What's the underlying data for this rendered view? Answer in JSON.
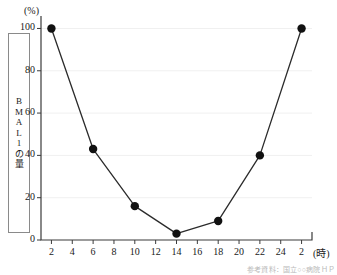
{
  "chart_data": {
    "type": "line",
    "title": "",
    "xlabel": "(時)",
    "ylabel": "BMAL1の量",
    "yunit": "(%)",
    "x": [
      2,
      6,
      10,
      14,
      18,
      22,
      26
    ],
    "values": [
      100,
      43,
      16,
      3,
      9,
      40,
      100
    ],
    "xtick_labels": [
      "2",
      "4",
      "6",
      "8",
      "10",
      "12",
      "14",
      "16",
      "18",
      "20",
      "22",
      "24",
      "2"
    ],
    "xtick_values": [
      2,
      4,
      6,
      8,
      10,
      12,
      14,
      16,
      18,
      20,
      22,
      24,
      26
    ],
    "ytick_labels": [
      "0",
      "20",
      "40",
      "60",
      "80",
      "100"
    ],
    "ytick_values": [
      0,
      20,
      40,
      60,
      80,
      100
    ],
    "xlim": [
      1,
      27
    ],
    "ylim": [
      0,
      104
    ],
    "grid": true,
    "legend": "none",
    "series_color": "#2b2b2b",
    "marker_color": "#111111",
    "grid_color": "#f0f0f0",
    "axis_color": "#3b3b3b"
  },
  "axis_title": {
    "y_stacked": "B\nM\nA\nL\n1\nの\n量"
  },
  "footer": {
    "attribution": "参考資料：国立○○病院ＨＰ"
  }
}
